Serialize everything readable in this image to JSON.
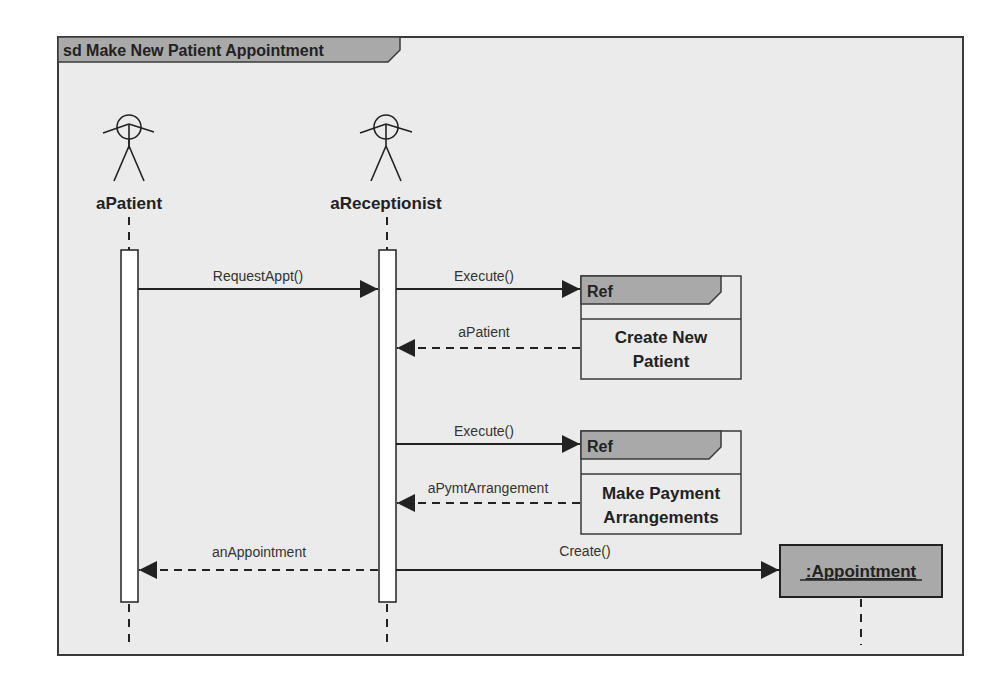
{
  "diagram": {
    "type": "UML sequence diagram",
    "frame_title": "sd Make New Patient Appointment",
    "colors": {
      "background": "#ebebeb",
      "header_fill": "#a9a9a9",
      "line": "#222222",
      "activation_fill": "#ffffff"
    },
    "lifelines": [
      {
        "id": "patient",
        "label": "aPatient",
        "kind": "actor"
      },
      {
        "id": "receptionist",
        "label": "aReceptionist",
        "kind": "actor"
      },
      {
        "id": "appointment",
        "label": ":Appointment",
        "kind": "object"
      }
    ],
    "refs": [
      {
        "tag": "Ref",
        "line1": "Create New",
        "line2": "Patient"
      },
      {
        "tag": "Ref",
        "line1": "Make Payment",
        "line2": "Arrangements"
      }
    ],
    "messages": [
      {
        "label": "RequestAppt()",
        "from": "aPatient",
        "to": "aReceptionist",
        "style": "sync"
      },
      {
        "label": "Execute()",
        "from": "aReceptionist",
        "to": "Ref: Create New Patient",
        "style": "sync"
      },
      {
        "label": "aPatient",
        "from": "Ref: Create New Patient",
        "to": "aReceptionist",
        "style": "return"
      },
      {
        "label": "Execute()",
        "from": "aReceptionist",
        "to": "Ref: Make Payment Arrangements",
        "style": "sync"
      },
      {
        "label": "aPymtArrangement",
        "from": "Ref: Make Payment Arrangements",
        "to": "aReceptionist",
        "style": "return"
      },
      {
        "label": "anAppointment",
        "from": "aReceptionist",
        "to": "aPatient",
        "style": "return"
      },
      {
        "label": "Create()",
        "from": "aReceptionist",
        "to": ":Appointment",
        "style": "create"
      }
    ]
  }
}
